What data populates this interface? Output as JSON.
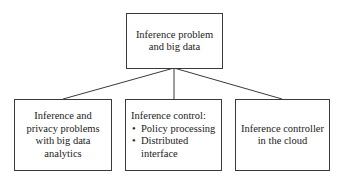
{
  "diagram": {
    "root": {
      "label": "Inference problem and big data"
    },
    "children": [
      {
        "label": "Inference and privacy problems with big data analytics"
      },
      {
        "title": "Inference control:",
        "bullets": [
          "Policy processing",
          "Distributed interface"
        ]
      },
      {
        "label": "Inference controller in the cloud"
      }
    ],
    "line_color": "#3a3a3a"
  }
}
